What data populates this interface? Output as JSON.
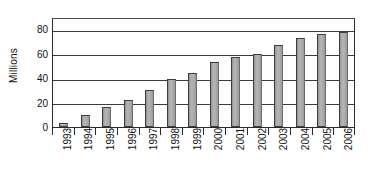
{
  "chart_data": {
    "type": "bar",
    "title": "",
    "xlabel": "",
    "ylabel": "Millions",
    "categories": [
      "1993",
      "1994",
      "1995",
      "1996",
      "1997",
      "1998",
      "1999",
      "2000",
      "2001",
      "2002",
      "2003",
      "2004",
      "2005",
      "2006"
    ],
    "values": [
      3,
      10,
      16,
      22,
      30,
      39,
      44,
      53,
      57,
      60,
      67,
      73,
      76,
      78
    ],
    "ylim": [
      0,
      90
    ],
    "yticks": [
      0,
      20,
      40,
      60,
      80
    ],
    "ytick_labels": [
      "0",
      "20",
      "40",
      "60",
      "80"
    ],
    "grid": true,
    "legend": "none",
    "series": [
      {
        "name": "",
        "values": [
          3,
          10,
          16,
          22,
          30,
          39,
          44,
          53,
          57,
          60,
          67,
          73,
          76,
          78
        ]
      }
    ],
    "colors": {
      "bar_fill": "#a9a9a9",
      "bar_stroke": "#3d3d3d",
      "axis": "#2b2b2b",
      "grid": "#3a3a3a",
      "background": "#ffffff",
      "text": "#111111"
    }
  }
}
